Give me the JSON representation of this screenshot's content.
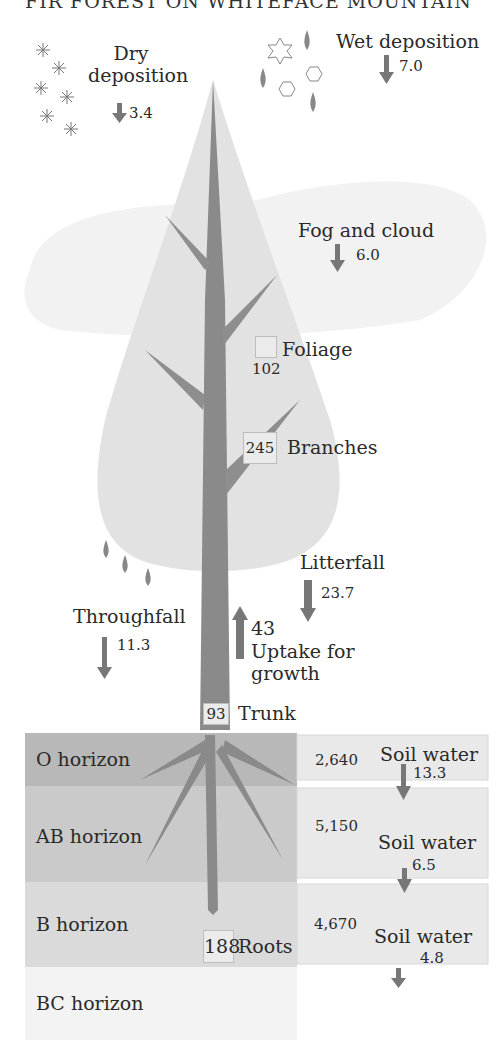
{
  "title": "FIR FOREST ON WHITEFACE MOUNTAIN",
  "colors": {
    "crown": "#e3e3e3",
    "cloud": "#f1f1f1",
    "trunk": "#8a8a8a",
    "arrow": "#777777",
    "o_horizon": "#b9b9b9",
    "ab_horizon": "#cbcbcb",
    "b_horizon": "#dcdcdc",
    "bc_horizon": "#f3f3f3",
    "soil_water_box": "#e8e8e8"
  },
  "inputs": {
    "dry_deposition": {
      "label_line1": "Dry",
      "label_line2": "deposition",
      "value": "3.4",
      "icon": "snowflake-asterisk-icon"
    },
    "wet_deposition": {
      "label": "Wet deposition",
      "value": "7.0",
      "icon": "raindrop-hexagon-star-icon"
    },
    "fog_and_cloud": {
      "label": "Fog and cloud",
      "value": "6.0"
    }
  },
  "pools": {
    "foliage": {
      "label": "Foliage",
      "value": "102"
    },
    "branches": {
      "label": "Branches",
      "value": "245"
    },
    "trunk": {
      "label": "Trunk",
      "value": "93"
    },
    "roots": {
      "label": "Roots",
      "value": "188"
    }
  },
  "fluxes": {
    "throughfall": {
      "label": "Throughfall",
      "value": "11.3"
    },
    "litterfall": {
      "label": "Litterfall",
      "value": "23.7"
    },
    "uptake": {
      "value": "43",
      "label_line1": "Uptake for",
      "label_line2": "growth"
    }
  },
  "soil": {
    "horizons": [
      {
        "label": "O horizon",
        "pool": "2,640",
        "soil_water_label": "Soil water",
        "soil_water_value": "13.3"
      },
      {
        "label": "AB horizon",
        "pool": "5,150",
        "soil_water_label": "Soil water",
        "soil_water_value": "6.5"
      },
      {
        "label": "B horizon",
        "pool": "4,670",
        "soil_water_label": "Soil water",
        "soil_water_value": "4.8"
      },
      {
        "label": "BC horizon"
      }
    ]
  }
}
